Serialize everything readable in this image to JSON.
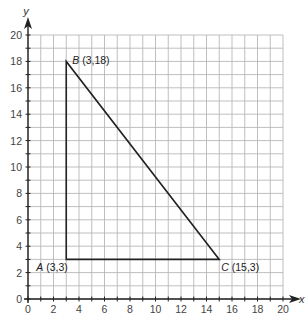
{
  "diagram": {
    "type": "coordinate-grid",
    "axes": {
      "x": {
        "label": "x",
        "min": 0,
        "max": 20,
        "tick_labels": [
          "0",
          "2",
          "4",
          "6",
          "8",
          "10",
          "12",
          "14",
          "16",
          "18",
          "20"
        ]
      },
      "y": {
        "label": "y",
        "min": 0,
        "max": 20,
        "tick_labels": [
          "0",
          "2",
          "4",
          "6",
          "8",
          "10",
          "12",
          "14",
          "16",
          "18",
          "20"
        ]
      }
    },
    "points": [
      {
        "name": "A",
        "coords": "(3,3)",
        "x": 3,
        "y": 3
      },
      {
        "name": "B",
        "coords": "(3,18)",
        "x": 3,
        "y": 18
      },
      {
        "name": "C",
        "coords": "(15,3)",
        "x": 15,
        "y": 3
      }
    ],
    "shape": "triangle ABC",
    "colors": {
      "grid": "#b8b8b8",
      "axis": "#222222",
      "triangle": "#222222"
    }
  }
}
